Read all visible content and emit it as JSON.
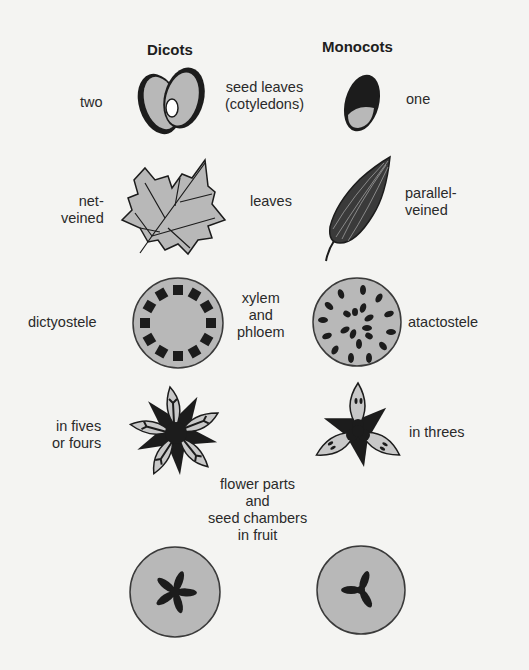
{
  "headers": {
    "left": "Dicots",
    "right": "Monocots"
  },
  "rows": [
    {
      "feature": [
        "seed leaves",
        "(cotyledons)"
      ],
      "dicot": [
        "two"
      ],
      "monocot": [
        "one"
      ]
    },
    {
      "feature": [
        "leaves"
      ],
      "dicot": [
        "net-",
        "veined"
      ],
      "monocot": [
        "parallel-",
        "veined"
      ]
    },
    {
      "feature": [
        "xylem",
        "and",
        "phloem"
      ],
      "dicot": [
        "dictyostele"
      ],
      "monocot": [
        "atactostele"
      ]
    },
    {
      "feature": [
        "flower parts",
        "and",
        "seed chambers",
        "in fruit"
      ],
      "dicot": [
        "in fives",
        "or fours"
      ],
      "monocot": [
        "in threes"
      ]
    }
  ],
  "colors": {
    "background": "#f4f4f2",
    "fill_gray": "#b8b8b8",
    "dark": "#1c1c1c"
  }
}
